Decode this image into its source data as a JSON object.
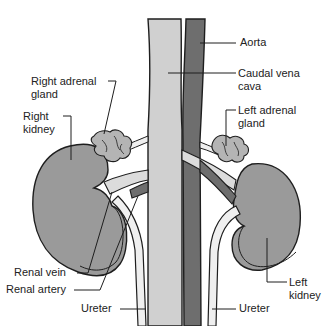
{
  "diagram": {
    "colors": {
      "background": "#ffffff",
      "vena_cava": "#d0d0d0",
      "aorta": "#6e6e6e",
      "kidney": "#9a9a9a",
      "adrenal": "#b4b4b4",
      "ureter": "#efefef",
      "renal_vein": "#dcdcdc",
      "renal_artery": "#6e6e6e",
      "outline": "#1e1e1e",
      "label_text": "#222222"
    },
    "labels": {
      "aorta": "Aorta",
      "caudal_vena_cava_line1": "Caudal vena",
      "caudal_vena_cava_line2": "cava",
      "left_adrenal_line1": "Left adrenal",
      "left_adrenal_line2": "gland",
      "right_adrenal_line1": "Right adrenal",
      "right_adrenal_line2": "gland",
      "right_kidney_line1": "Right",
      "right_kidney_line2": "kidney",
      "renal_vein": "Renal vein",
      "renal_artery": "Renal artery",
      "ureter_left_side": "Ureter",
      "ureter_right_side": "Ureter",
      "left_kidney_line1": "Left",
      "left_kidney_line2": "kidney"
    }
  }
}
